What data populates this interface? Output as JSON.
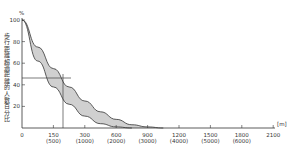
{
  "chart_data": {
    "type": "area",
    "title": "",
    "ylabel": "歩行距離超過距離的人數百分比",
    "y_unit": "%",
    "x_unit": "[m]",
    "ylim": [
      0,
      100
    ],
    "y_ticks": [
      "100",
      "80",
      "60",
      "40",
      "20",
      "0"
    ],
    "x_ticks": [
      {
        "label": "0",
        "sub": ""
      },
      {
        "label": "150",
        "sub": "(500)"
      },
      {
        "label": "300",
        "sub": "(1000)"
      },
      {
        "label": "600",
        "sub": "(2000)"
      },
      {
        "label": "900",
        "sub": "(3000)"
      },
      {
        "label": "1200",
        "sub": "(4000)"
      },
      {
        "label": "1500",
        "sub": "(5000)"
      },
      {
        "label": "1800",
        "sub": "(6000)"
      },
      {
        "label": "2100",
        "sub": ""
      }
    ],
    "series": [
      {
        "name": "lower-bound-curve",
        "x_tick_index": [
          0,
          0.5,
          1,
          1.5,
          2,
          2.5,
          3,
          3.5
        ],
        "values": [
          100,
          62,
          38,
          22,
          11,
          4,
          1,
          0
        ]
      },
      {
        "name": "upper-bound-curve",
        "x_tick_index": [
          0,
          0.5,
          1,
          1.5,
          2,
          2.5,
          3,
          3.5,
          4,
          4.5
        ],
        "values": [
          100,
          75,
          55,
          38,
          25,
          15,
          8,
          3,
          1,
          0
        ]
      }
    ],
    "reference_lines": {
      "horizontal_value": 46,
      "vertical_x_label": "150 (500)"
    },
    "band_fill": "#d0d0d0",
    "grid": false,
    "legend": "none"
  }
}
